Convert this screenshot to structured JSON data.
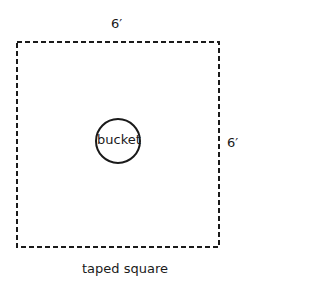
{
  "diagram": {
    "top_dimension": "6′",
    "right_dimension": "6′",
    "center_object": "bucket",
    "caption": "taped square"
  },
  "colors": {
    "line": "#1a1a1a",
    "background": "#ffffff"
  }
}
